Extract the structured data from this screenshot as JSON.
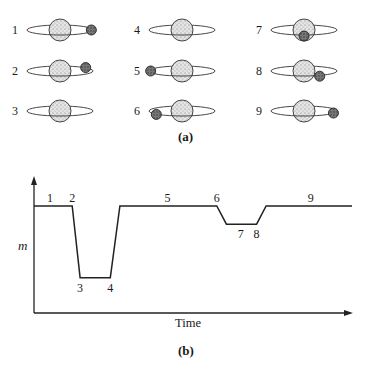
{
  "panel_a": {
    "caption": "(a)",
    "frames": [
      {
        "label": "1",
        "planet_position": "right of star, outside disk",
        "planet_angle_deg": 0,
        "planet_in_front": true
      },
      {
        "label": "2",
        "planet_position": "touching star upper-right",
        "planet_angle_deg": 35,
        "planet_in_front": false
      },
      {
        "label": "3",
        "planet_position": "behind star (hidden)",
        "planet_angle_deg": 90,
        "planet_in_front": false
      },
      {
        "label": "4",
        "planet_position": "behind star (hidden)",
        "planet_angle_deg": 110,
        "planet_in_front": false
      },
      {
        "label": "5",
        "planet_position": "left of star",
        "planet_angle_deg": 180,
        "planet_in_front": true
      },
      {
        "label": "6",
        "planet_position": "touching star lower-left",
        "planet_angle_deg": 215,
        "planet_in_front": true
      },
      {
        "label": "7",
        "planet_position": "in front of star center",
        "planet_angle_deg": 270,
        "planet_in_front": true
      },
      {
        "label": "8",
        "planet_position": "in front of star lower-right",
        "planet_angle_deg": 300,
        "planet_in_front": true
      },
      {
        "label": "9",
        "planet_position": "right of star",
        "planet_angle_deg": 340,
        "planet_in_front": true
      }
    ]
  },
  "panel_b": {
    "caption": "(b)",
    "ylabel": "m",
    "xlabel": "Time"
  },
  "chart_data": {
    "type": "line",
    "title": "",
    "xlabel": "Time",
    "ylabel": "m",
    "grid": false,
    "xlim": [
      0,
      100
    ],
    "ylim": [
      0,
      100
    ],
    "series": [
      {
        "name": "light curve",
        "x": [
          0,
          12,
          14.5,
          24,
          27,
          57.5,
          60.5,
          70,
          73,
          100
        ],
        "y": [
          100,
          100,
          33,
          33,
          100,
          100,
          83,
          83,
          100,
          100
        ]
      }
    ],
    "annotations": [
      {
        "text": "1",
        "x": 5,
        "y": 100,
        "side": "above"
      },
      {
        "text": "2",
        "x": 12,
        "y": 100,
        "side": "above"
      },
      {
        "text": "3",
        "x": 14.5,
        "y": 33,
        "side": "below"
      },
      {
        "text": "4",
        "x": 24,
        "y": 33,
        "side": "below"
      },
      {
        "text": "5",
        "x": 42,
        "y": 100,
        "side": "above"
      },
      {
        "text": "6",
        "x": 57.5,
        "y": 100,
        "side": "above"
      },
      {
        "text": "7",
        "x": 65,
        "y": 83,
        "side": "below"
      },
      {
        "text": "8",
        "x": 70,
        "y": 83,
        "side": "below"
      },
      {
        "text": "9",
        "x": 87,
        "y": 100,
        "side": "above"
      }
    ]
  }
}
